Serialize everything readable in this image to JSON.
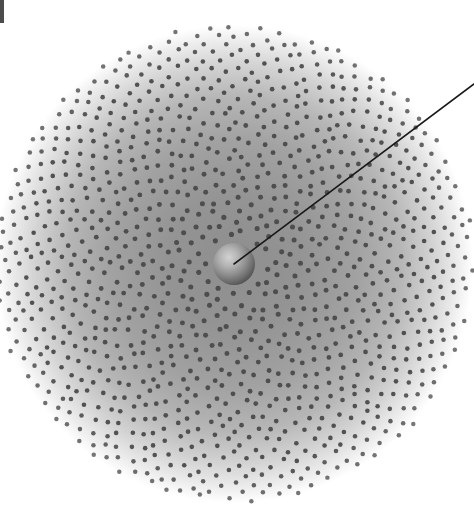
{
  "figure": {
    "width": 474,
    "height": 518,
    "background_color": "#ffffff"
  },
  "disc": {
    "name": "dot-disc",
    "center_x": 234,
    "center_y": 264,
    "radius": 239,
    "halo_inner_color": "#8e8e8e",
    "halo_mid_color": "#a8a8a8",
    "halo_outer_color": "#ffffff",
    "halo_description": "soft grey radial haze, darkest near centre fading to white at the rim"
  },
  "dots": {
    "name": "dot-field",
    "count": 1150,
    "color": "#4a4a4a",
    "min_diameter": 3.6,
    "max_diameter": 5.2,
    "pattern": "phyllotaxis spiral, golden-angle 137.508 degrees",
    "inner_gap_radius": 26,
    "outer_radius": 239
  },
  "core": {
    "name": "central-sphere",
    "center_x": 234,
    "center_y": 264,
    "radius": 21,
    "highlight_color": "#cfcfcf",
    "mid_color": "#9a9a9a",
    "edge_color": "#4f4f4f",
    "label": "central sphere"
  },
  "pointer": {
    "name": "pointer-line",
    "x1": 234,
    "y1": 264,
    "x2": 474,
    "y2": 84,
    "color": "#1a1a1a",
    "width": 1.6,
    "label": "radius pointer"
  },
  "edge_mark": {
    "name": "corner-crop-mark",
    "x": 0,
    "y": 0,
    "width": 4,
    "height": 23,
    "color": "#4c4c4c"
  }
}
